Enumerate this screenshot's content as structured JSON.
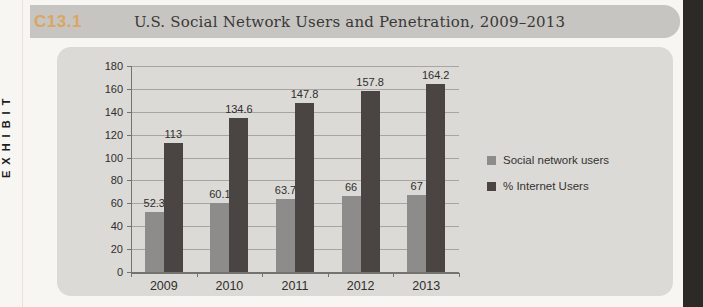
{
  "page": {
    "sidebar_label": "EXHIBIT",
    "exhibit_code": "C13.1",
    "title": "U.S. Social Network Users and Penetration, 2009–2013"
  },
  "colors": {
    "band": "#c6c5c2",
    "panel": "#dcdad7",
    "exhibit_code_text": "#dba563",
    "edge_strip": "#2c2a27",
    "series_gray": "#8d8c8a",
    "series_dark": "#4a4543"
  },
  "chart_data": {
    "type": "bar",
    "title": "U.S. Social Network Users and Penetration, 2009–2013",
    "categories": [
      "2009",
      "2010",
      "2011",
      "2012",
      "2013"
    ],
    "series": [
      {
        "name": "Social network users",
        "color": "#8d8c8a",
        "values": [
          52.3,
          60.1,
          63.7,
          66,
          67
        ]
      },
      {
        "name": "% Internet Users",
        "color": "#4a4543",
        "values": [
          113,
          134.6,
          147.8,
          157.8,
          164.2
        ]
      }
    ],
    "xlabel": "",
    "ylabel": "",
    "ylim": [
      0,
      180
    ],
    "ytick_step": 20,
    "grid": true,
    "data_labels": true,
    "legend_position": "right"
  }
}
